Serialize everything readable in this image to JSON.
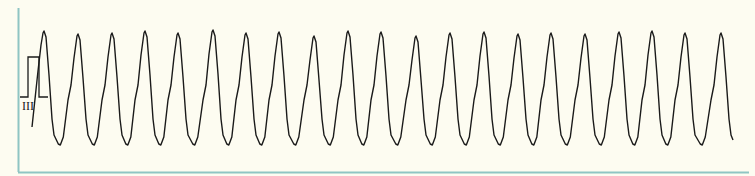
{
  "chart_data": {
    "type": "line",
    "title": "",
    "xlabel": "",
    "ylabel": "",
    "lead_label": "III",
    "grid": false,
    "calibration_pulse": {
      "x_start": 28,
      "x_end": 39,
      "baseline_y": 97,
      "top_y": 57
    },
    "peaks_x": [
      44,
      78,
      112,
      145,
      178,
      213,
      246,
      279,
      314,
      348,
      381,
      416,
      450,
      484,
      518,
      551,
      585,
      619,
      652,
      685,
      721
    ],
    "peak_y": 31,
    "trough_y": 145,
    "period_px": 33.8,
    "beat_count": 21,
    "trace_start": {
      "x": 32,
      "y": 127
    },
    "trace_end": {
      "x": 733,
      "y": 140
    }
  },
  "colors": {
    "background": "#fdfcf1",
    "border": "#8fc5c3",
    "trace": "#1a1a1a"
  }
}
